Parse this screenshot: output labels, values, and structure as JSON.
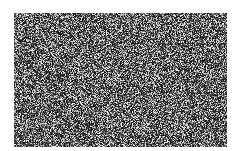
{
  "image": {
    "description": "grayscale random noise texture",
    "background": "#ffffff",
    "noise_region": {
      "x": 14,
      "y": 13,
      "width": 213,
      "height": 134
    },
    "tone_range": [
      "#1a1a1a",
      "#e0e0e0"
    ],
    "mean_tone": "#555555"
  }
}
